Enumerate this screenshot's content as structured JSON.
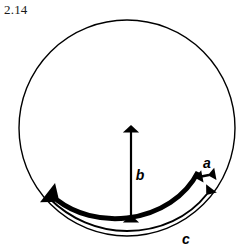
{
  "figure": {
    "number": "2.14",
    "background_color": "#ffffff",
    "stroke_color": "#000000"
  },
  "circle": {
    "name": "outer-circle",
    "center_x": 127,
    "center_y": 128,
    "radius": 108,
    "stroke_width": 1.4,
    "fill": "none"
  },
  "labels": {
    "a": "a",
    "b": "b",
    "c": "c"
  },
  "label_positions": {
    "a": {
      "x": 207,
      "y": 168
    },
    "b": {
      "x": 139,
      "y": 176
    },
    "c": {
      "x": 186,
      "y": 243
    }
  },
  "arrows": {
    "b_arrow": {
      "name": "vertical-double-arrow-b",
      "type": "double-headed-straight",
      "x": 131,
      "y_top": 124,
      "y_bottom": 218,
      "stroke_width": 2.2
    },
    "a_arrow": {
      "name": "short-double-arrow-a",
      "type": "double-headed-straight",
      "x_left": 194,
      "y_left": 178,
      "x_right": 211,
      "y_right": 175,
      "stroke_width": 2.0
    },
    "thick_arc": {
      "name": "thick-arc-arrow",
      "type": "arc-with-arrowhead-left",
      "stroke_width": 5.0
    },
    "thin_arc_c": {
      "name": "thin-arc-arrow-c",
      "type": "arc-with-arrowhead-right",
      "stroke_width": 2.0
    }
  }
}
